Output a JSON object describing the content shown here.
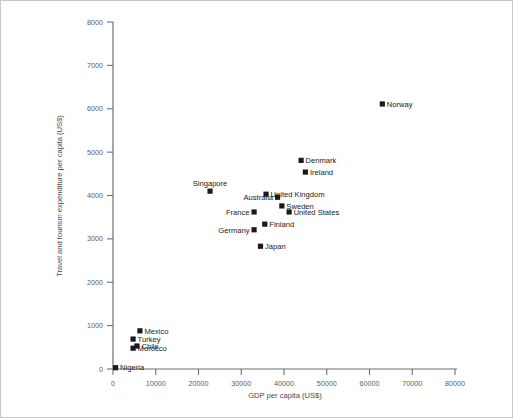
{
  "chart_data": {
    "type": "scatter",
    "title": "",
    "xlabel": "GDP per capita (US$)",
    "ylabel": "Travel and tourism expenditure per capita (US$)",
    "xlim": [
      0,
      80000
    ],
    "ylim": [
      0,
      8000
    ],
    "xticks": [
      0,
      10000,
      20000,
      30000,
      40000,
      50000,
      60000,
      70000,
      80000
    ],
    "yticks": [
      0,
      1000,
      2000,
      3000,
      4000,
      5000,
      6000,
      7000,
      8000
    ],
    "xticklabels": [
      "0",
      "10000",
      "20000",
      "30000",
      "40000",
      "50000",
      "60000",
      "70000",
      "80000"
    ],
    "yticklabels": [
      "0",
      "1000",
      "2000",
      "3000",
      "4000",
      "5000",
      "6000",
      "7000",
      "8000"
    ],
    "grid": false,
    "legend": false,
    "marker_color": "#1a1a1a",
    "marker_shape": "square",
    "points": [
      {
        "label": "Norway",
        "x": 63000,
        "y": 6110,
        "label_pos": "right"
      },
      {
        "label": "Denmark",
        "x": 44000,
        "y": 4810,
        "label_pos": "right"
      },
      {
        "label": "Ireland",
        "x": 45000,
        "y": 4540,
        "label_pos": "right"
      },
      {
        "label": "Singapore",
        "x": 22700,
        "y": 4100,
        "label_pos": "above"
      },
      {
        "label": "United Kingdom",
        "x": 35800,
        "y": 4030,
        "label_pos": "right"
      },
      {
        "label": "Australia",
        "x": 38500,
        "y": 3960,
        "label_pos": "left"
      },
      {
        "label": "Sweden",
        "x": 39500,
        "y": 3760,
        "label_pos": "right"
      },
      {
        "label": "United States",
        "x": 41200,
        "y": 3620,
        "label_pos": "right"
      },
      {
        "label": "France",
        "x": 33000,
        "y": 3620,
        "label_pos": "left"
      },
      {
        "label": "Finland",
        "x": 35500,
        "y": 3340,
        "label_pos": "right"
      },
      {
        "label": "Germany",
        "x": 33000,
        "y": 3210,
        "label_pos": "left"
      },
      {
        "label": "Japan",
        "x": 34500,
        "y": 2830,
        "label_pos": "right"
      },
      {
        "label": "Mexico",
        "x": 6300,
        "y": 880,
        "label_pos": "right"
      },
      {
        "label": "Turkey",
        "x": 4700,
        "y": 690,
        "label_pos": "right"
      },
      {
        "label": "Chile",
        "x": 5600,
        "y": 530,
        "label_pos": "right"
      },
      {
        "label": "Morocco",
        "x": 4700,
        "y": 480,
        "label_pos": "right"
      },
      {
        "label": "Nigeria",
        "x": 600,
        "y": 30,
        "label_pos": "right"
      }
    ]
  }
}
